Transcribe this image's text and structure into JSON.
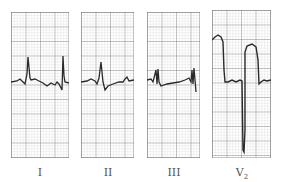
{
  "figure": {
    "type": "ecg-leads",
    "leads": [
      {
        "label": "I",
        "sub": ""
      },
      {
        "label": "II",
        "sub": ""
      },
      {
        "label": "III",
        "sub": ""
      },
      {
        "label": "V",
        "sub": "2"
      }
    ]
  },
  "colors": {
    "grid_minor": "#c8c8c8",
    "grid_major": "#6a6a6a",
    "trace": "#2a2a2a",
    "label": "#555555"
  }
}
